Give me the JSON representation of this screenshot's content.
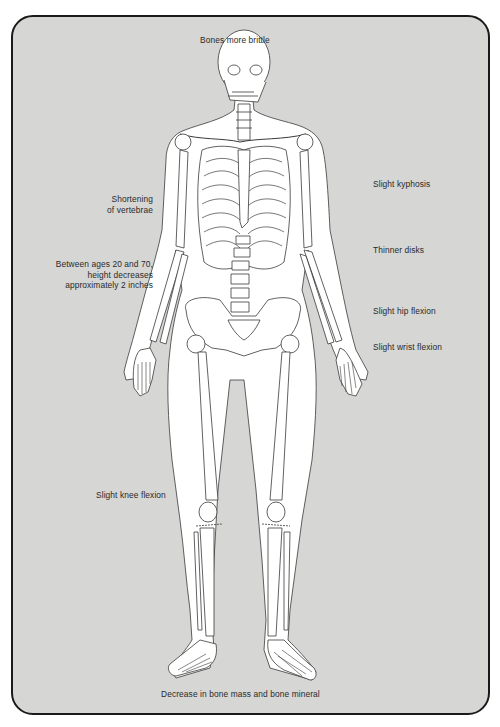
{
  "figure": {
    "title_top": "Bones more brittle",
    "caption_bottom": "Decrease in bone mass and bone mineral",
    "left_labels": {
      "shortening_line1": "Shortening",
      "shortening_line2": "of vertebrae",
      "height_line1": "Between ages 20 and 70,",
      "height_line2": "height decreases",
      "height_line3": "approximately 2 inches",
      "knee": "Slight  knee flexion"
    },
    "right_labels": {
      "kyphosis": "Slight kyphosis",
      "disks": "Thinner disks",
      "hip": "Slight hip flexion",
      "wrist": "Slight wrist flexion"
    },
    "colors": {
      "panel_fill": "#d6d6d4",
      "panel_border": "#1a1a1a",
      "bone_fill": "#ffffff",
      "line": "#3a3a3a"
    }
  }
}
